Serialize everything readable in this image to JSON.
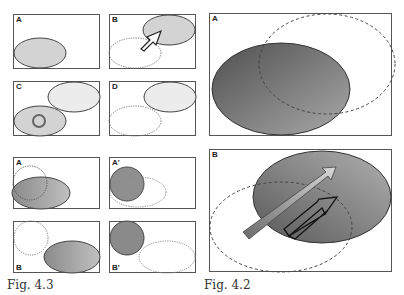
{
  "figures": {
    "fig43": {
      "caption": "Fig. 4.3",
      "panels": [
        {
          "label": "A"
        },
        {
          "label": "B"
        },
        {
          "label": "C"
        },
        {
          "label": "D"
        },
        {
          "label": "A"
        },
        {
          "label": "A'"
        },
        {
          "label": "B"
        },
        {
          "label": "B'"
        }
      ]
    },
    "fig42": {
      "caption": "Fig. 4.2",
      "panels": [
        {
          "label": "A"
        },
        {
          "label": "B"
        }
      ]
    }
  },
  "colors": {
    "border": "#555555",
    "light_fill": "#d4d4d4",
    "lighter_fill": "#ececec",
    "dark_fill_start": "#5c5c5c",
    "dark_fill_end": "#a8a8a8",
    "dashed": "#666666"
  }
}
